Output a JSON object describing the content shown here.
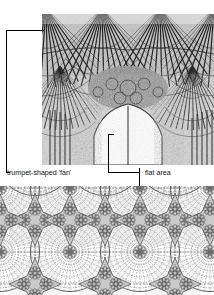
{
  "figure": {
    "kind": "architecture-diagram",
    "background_color": "#ffffff",
    "ink_color": "#111111"
  },
  "photo": {
    "name": "fan-vault-ceiling-photograph",
    "description": "black and white photograph of a late gothic fan vault ceiling seen from below, with conoid fans springing from piers and a pointed arch opening at the lower centre",
    "alt": "fan vault ceiling",
    "tone_dark": "#1a1a1a",
    "tone_mid": "#8a8a8a",
    "tone_light": "#e8e8e8"
  },
  "annotations": [
    {
      "id": "fan",
      "label": "trumpet-shaped 'fan'",
      "target": "conoid springing from the pier at the left of the photograph"
    },
    {
      "id": "flat",
      "label": "flat area",
      "target": "the flat spandrel panel between adjacent fans"
    }
  ],
  "plan": {
    "name": "fan-vault-plan-drawing",
    "description": "line drawing plan of fan vaulting showing circular fans with radiating ribs and concentric arcs, meeting at star shaped flat spandrels filled with carved rosette bosses",
    "fan_columns": [
      0,
      70,
      140,
      210
    ],
    "fan_rows": [
      2,
      66
    ],
    "fan_radius": 40,
    "rib_count": 26,
    "arc_rings": 7,
    "rosette_petals": 8,
    "line_color": "#5a5a5a",
    "rib_color": "#707070"
  }
}
